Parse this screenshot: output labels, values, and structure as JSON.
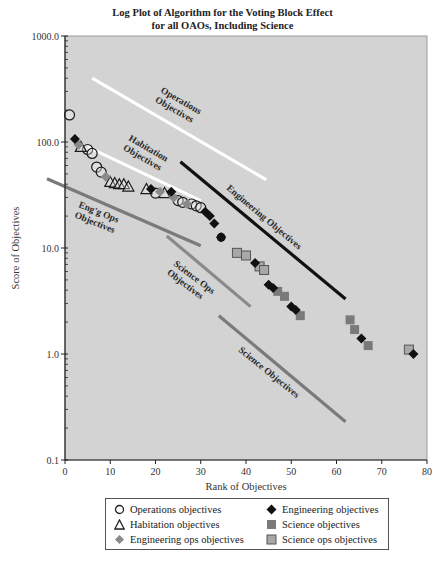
{
  "chart_data": {
    "type": "scatter",
    "title": "Log Plot of Algorithm for the Voting Block Effect",
    "subtitle": "for all OAOs, Including Science",
    "xlabel": "Rank of Objectives",
    "ylabel": "Score of Objectives",
    "xlim": [
      0,
      80
    ],
    "ylim": [
      0.1,
      1000.0
    ],
    "yscale": "log",
    "x_ticks": [
      "0",
      "10",
      "20",
      "30",
      "40",
      "50",
      "60",
      "70",
      "80"
    ],
    "y_ticks": [
      "0.1",
      "1.0",
      "10.0",
      "100.0",
      "1000.0"
    ],
    "grid": false,
    "legend_position": "bottom",
    "series": [
      {
        "name": "Operations objectives",
        "marker": "circle-open",
        "color": "#ffffff",
        "points": [
          [
            1,
            180
          ],
          [
            5,
            85
          ],
          [
            6,
            78
          ],
          [
            7,
            58
          ],
          [
            8,
            52
          ],
          [
            20,
            33
          ],
          [
            25,
            28
          ],
          [
            26,
            27
          ],
          [
            28,
            26
          ],
          [
            29,
            25
          ],
          [
            30,
            24
          ]
        ]
      },
      {
        "name": "Habitation objectives",
        "marker": "triangle-open",
        "color": "#ffffff",
        "points": [
          [
            3.5,
            90
          ],
          [
            10,
            42
          ],
          [
            11,
            41
          ],
          [
            12,
            40
          ],
          [
            13,
            40
          ],
          [
            14,
            38
          ],
          [
            18,
            36
          ],
          [
            22,
            33
          ]
        ]
      },
      {
        "name": "Engineering ops objectives",
        "marker": "diamond",
        "color": "#8a8a8a",
        "points": [
          [
            3,
            94
          ],
          [
            9,
            47
          ],
          [
            21,
            34
          ],
          [
            24,
            30
          ],
          [
            27,
            26
          ]
        ]
      },
      {
        "name": "Engineering objectives",
        "marker": "diamond",
        "color": "#111111",
        "points": [
          [
            2.2,
            107
          ],
          [
            19,
            36
          ],
          [
            23.5,
            34
          ],
          [
            31,
            22
          ],
          [
            32,
            20
          ],
          [
            33,
            17
          ],
          [
            34.5,
            12.6
          ],
          [
            42,
            7.2
          ],
          [
            45,
            4.5
          ],
          [
            46,
            4.2
          ],
          [
            50,
            2.8
          ],
          [
            51,
            2.6
          ],
          [
            65.5,
            1.4
          ],
          [
            77,
            1.0
          ]
        ]
      },
      {
        "name": "Science objectives",
        "marker": "square",
        "color": "#7a7a7a",
        "points": [
          [
            47,
            3.9
          ],
          [
            48.5,
            3.5
          ],
          [
            52,
            2.3
          ],
          [
            63,
            2.1
          ],
          [
            64,
            1.7
          ],
          [
            67,
            1.2
          ]
        ]
      },
      {
        "name": "Science ops objectives",
        "marker": "square-outlined",
        "color": "#a8a8a8",
        "points": [
          [
            38,
            9.0
          ],
          [
            40,
            8.5
          ],
          [
            43,
            6.7
          ],
          [
            44,
            6.2
          ],
          [
            76,
            1.1
          ]
        ]
      }
    ],
    "annotations": [
      {
        "text": "Operations Objectives",
        "line_color": "#ffffff",
        "line": [
          [
            6,
            400
          ],
          [
            44.5,
            44
          ]
        ]
      },
      {
        "text": "Habitation Objectives",
        "line_color": "#ffffff",
        "line": [
          [
            5,
            90
          ],
          [
            30,
            28
          ]
        ]
      },
      {
        "text": "Engineering Objectives",
        "line_color": "#111111",
        "line": [
          [
            25.5,
            65
          ],
          [
            62,
            3.3
          ]
        ]
      },
      {
        "text": "Eng'g Ops Objectives",
        "line_color": "#7a7a7a",
        "line": [
          [
            -4,
            45
          ],
          [
            30,
            10.5
          ]
        ]
      },
      {
        "text": "Science Ops Objectives",
        "line_color": "#8a8a8a",
        "line": [
          [
            22.5,
            13
          ],
          [
            41,
            2.8
          ]
        ]
      },
      {
        "text": "Science Objectives",
        "line_color": "#7a7a7a",
        "line": [
          [
            34,
            2.3
          ],
          [
            62,
            0.23
          ]
        ]
      }
    ]
  },
  "title_line1": "Log Plot of Algorithm for the Voting Block Effect",
  "title_line2": "for all OAOs, Including Science",
  "legend": {
    "items": [
      {
        "label": "Operations objectives",
        "marker": "circle-open"
      },
      {
        "label": "Engineering objectives",
        "marker": "diamond-black"
      },
      {
        "label": "Habitation objectives",
        "marker": "triangle-open"
      },
      {
        "label": "Science objectives",
        "marker": "square-gray"
      },
      {
        "label": "Engineering ops objectives",
        "marker": "diamond-gray"
      },
      {
        "label": "Science ops objectives",
        "marker": "square-outlined"
      }
    ]
  },
  "colors": {
    "plot_background": "#d3d3d3",
    "axis": "#333333",
    "engineering": "#111111",
    "science": "#7a7a7a",
    "science_ops": "#a8a8a8",
    "engineering_ops": "#8a8a8a"
  }
}
